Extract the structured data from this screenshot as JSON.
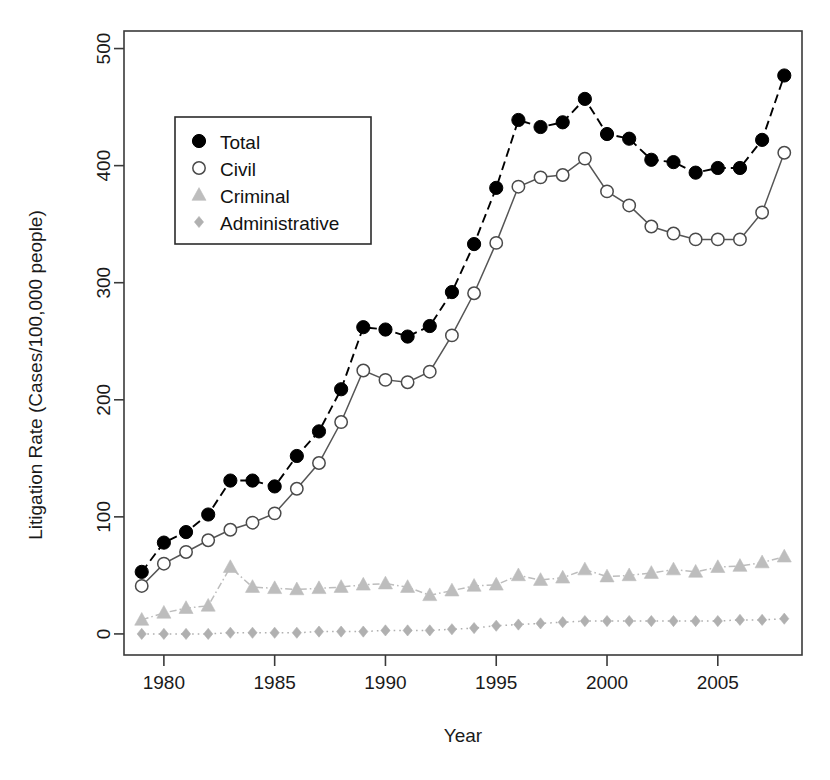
{
  "chart_data": {
    "type": "line",
    "title": "",
    "xlabel": "Year",
    "ylabel": "Litigation Rate (Cases/100,000 people)",
    "xlim": [
      1978.2,
      2008.8
    ],
    "ylim": [
      -18,
      515
    ],
    "xticks": [
      1980,
      1985,
      1990,
      1995,
      2000,
      2005
    ],
    "yticks": [
      0,
      100,
      200,
      300,
      400,
      500
    ],
    "grid": false,
    "legend_position": "upper-left-inset",
    "x": [
      1979,
      1980,
      1981,
      1982,
      1983,
      1984,
      1985,
      1986,
      1987,
      1988,
      1989,
      1990,
      1991,
      1992,
      1993,
      1994,
      1995,
      1996,
      1997,
      1998,
      1999,
      2000,
      2001,
      2002,
      2003,
      2004,
      2005,
      2006,
      2007,
      2008
    ],
    "series": [
      {
        "name": "Total",
        "marker": "filled-circle",
        "color": "#000000",
        "linestyle": "dashed",
        "values": [
          53,
          78,
          87,
          102,
          131,
          131,
          126,
          152,
          173,
          209,
          262,
          260,
          254,
          263,
          292,
          333,
          381,
          439,
          433,
          437,
          457,
          427,
          423,
          405,
          403,
          394,
          398,
          398,
          422,
          477
        ]
      },
      {
        "name": "Civil",
        "marker": "open-circle",
        "color": "#555555",
        "linestyle": "solid",
        "values": [
          41,
          60,
          70,
          80,
          89,
          95,
          103,
          124,
          146,
          181,
          225,
          217,
          215,
          224,
          255,
          291,
          334,
          382,
          390,
          392,
          406,
          378,
          366,
          348,
          342,
          337,
          337,
          337,
          360,
          411
        ]
      },
      {
        "name": "Criminal",
        "marker": "triangle",
        "color": "#bdbdbd",
        "linestyle": "dashdot",
        "values": [
          12,
          18,
          22,
          24,
          57,
          40,
          39,
          38,
          39,
          40,
          42,
          43,
          40,
          33,
          37,
          41,
          42,
          50,
          46,
          48,
          55,
          49,
          50,
          52,
          55,
          53,
          57,
          58,
          61,
          66
        ]
      },
      {
        "name": "Administrative",
        "marker": "diamond",
        "color": "#b0b0b0",
        "linestyle": "dotted",
        "values": [
          0,
          0,
          0,
          0,
          1,
          1,
          1,
          1,
          2,
          2,
          2,
          3,
          3,
          3,
          4,
          5,
          7,
          8,
          9,
          10,
          11,
          11,
          11,
          11,
          11,
          11,
          11,
          12,
          12,
          13
        ]
      }
    ],
    "legend_entries": [
      {
        "label": "Total",
        "marker": "filled-circle"
      },
      {
        "label": "Civil",
        "marker": "open-circle"
      },
      {
        "label": "Criminal",
        "marker": "triangle"
      },
      {
        "label": "Administrative",
        "marker": "diamond"
      }
    ]
  }
}
